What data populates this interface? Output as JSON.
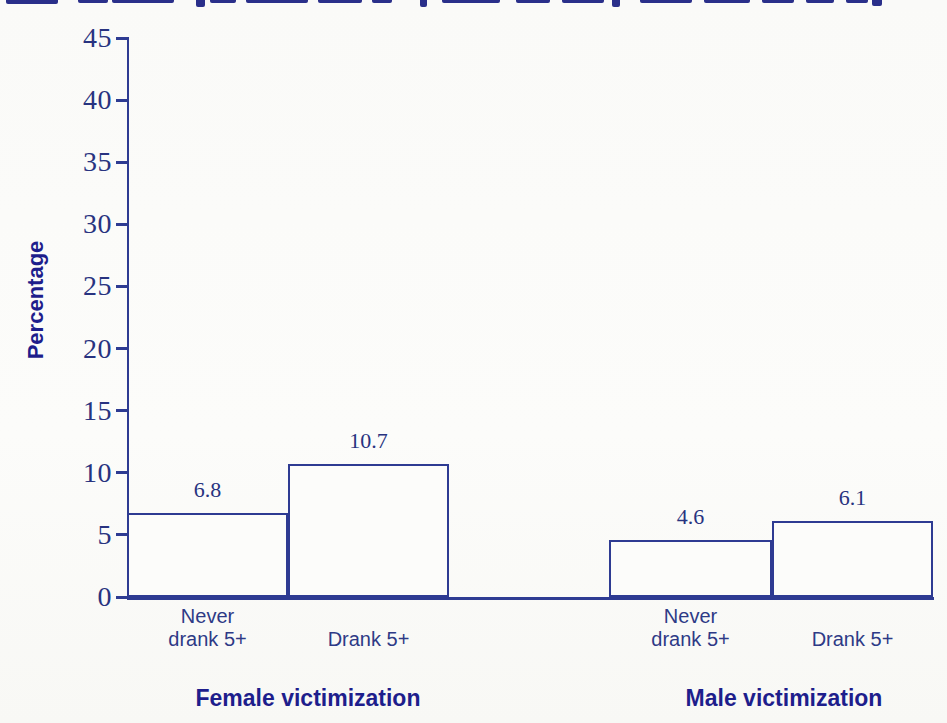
{
  "figure": {
    "cropped_title_note": "Title text is cut off at the top edge of the image; only the bottom tips of letters are visible (illegible)",
    "background": "#fbfbf9"
  },
  "colors": {
    "line_navy": "#2e3b92",
    "tick_text_navy": "#283380",
    "bold_label_navy": "#1e1e8c",
    "bar_fill": "#fcfcfa"
  },
  "chart_data": {
    "type": "bar",
    "title": "",
    "xlabel": "",
    "ylabel": "Percentage",
    "ylim": [
      0,
      45
    ],
    "yticks": [
      0,
      5,
      10,
      15,
      20,
      25,
      30,
      35,
      40,
      45
    ],
    "grid": false,
    "legend": false,
    "bar_style": "outlined rectangles, white fill, navy border, adjacent pairs",
    "groups": [
      {
        "label": "Female victimization",
        "bars": [
          {
            "category": "Never drank 5+",
            "category_lines": [
              "Never",
              "drank 5+"
            ],
            "value": 6.8,
            "value_label": "6.8"
          },
          {
            "category": "Drank 5+",
            "category_lines": [
              "Drank 5+"
            ],
            "value": 10.7,
            "value_label": "10.7"
          }
        ]
      },
      {
        "label": "Male victimization",
        "bars": [
          {
            "category": "Never drank 5+",
            "category_lines": [
              "Never",
              "drank 5+"
            ],
            "value": 4.6,
            "value_label": "4.6"
          },
          {
            "category": "Drank 5+",
            "category_lines": [
              "Drank 5+"
            ],
            "value": 6.1,
            "value_label": "6.1"
          }
        ]
      }
    ]
  }
}
